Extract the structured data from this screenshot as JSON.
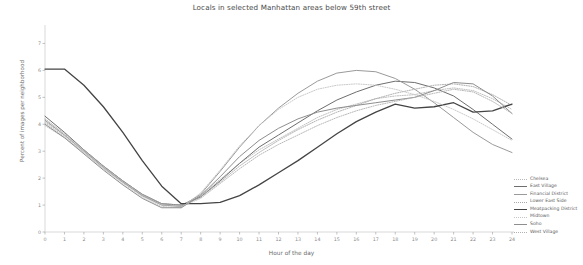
{
  "chart_data": {
    "type": "line",
    "title": "Locals in selected Manhattan areas below 59th street",
    "xlabel": "Hour of the day",
    "ylabel": "Percent of images per neighborhood",
    "grid": false,
    "legend_position": "right",
    "x": [
      0,
      1,
      2,
      3,
      4,
      5,
      6,
      7,
      8,
      9,
      10,
      11,
      12,
      13,
      14,
      15,
      16,
      17,
      18,
      19,
      20,
      21,
      22,
      23,
      24
    ],
    "xlim": [
      0,
      24
    ],
    "ylim": [
      0,
      7.5
    ],
    "xticks": [
      "0",
      "1",
      "2",
      "3",
      "4",
      "5",
      "6",
      "7",
      "8",
      "9",
      "10",
      "11",
      "12",
      "13",
      "14",
      "15",
      "16",
      "17",
      "18",
      "19",
      "20",
      "21",
      "22",
      "23",
      "24"
    ],
    "yticks": [
      "0",
      "1",
      "2",
      "3",
      "4",
      "5",
      "6",
      "7"
    ],
    "series": [
      {
        "name": "Chelsea",
        "color": "#b8b8b8",
        "style": "dotted",
        "width": 0.9,
        "values": [
          4.05,
          3.55,
          2.95,
          2.35,
          1.85,
          1.35,
          1.05,
          1.0,
          1.35,
          1.95,
          2.55,
          3.05,
          3.45,
          3.85,
          4.25,
          4.55,
          4.75,
          4.95,
          5.05,
          5.1,
          5.25,
          5.35,
          5.25,
          4.95,
          4.55
        ]
      },
      {
        "name": "East Village",
        "color": "#6e6e6e",
        "style": "solid",
        "width": 1.0,
        "values": [
          4.3,
          3.7,
          3.05,
          2.45,
          1.9,
          1.4,
          1.05,
          1.0,
          1.3,
          1.9,
          2.55,
          3.15,
          3.6,
          4.05,
          4.5,
          4.9,
          5.2,
          5.45,
          5.6,
          5.55,
          5.35,
          5.05,
          4.55,
          4.0,
          3.45
        ]
      },
      {
        "name": "Financial District",
        "color": "#9a9a9a",
        "style": "solid",
        "width": 1.0,
        "values": [
          4.15,
          3.6,
          3.0,
          2.4,
          1.85,
          1.35,
          1.0,
          0.95,
          1.4,
          2.25,
          3.15,
          3.95,
          4.6,
          5.15,
          5.6,
          5.9,
          6.0,
          5.95,
          5.7,
          5.3,
          4.8,
          4.25,
          3.7,
          3.25,
          2.95
        ]
      },
      {
        "name": "Lower East Side",
        "color": "#a8a8a8",
        "style": "dotted",
        "width": 0.9,
        "values": [
          4.2,
          3.65,
          3.05,
          2.45,
          1.9,
          1.4,
          1.05,
          1.0,
          1.3,
          1.85,
          2.45,
          2.95,
          3.4,
          3.8,
          4.15,
          4.45,
          4.7,
          4.95,
          5.15,
          5.3,
          5.45,
          5.5,
          5.4,
          5.1,
          4.7
        ]
      },
      {
        "name": "Meatpacking District",
        "color": "#444444",
        "style": "solid",
        "width": 1.3,
        "values": [
          6.05,
          6.05,
          5.45,
          4.65,
          3.7,
          2.65,
          1.7,
          1.05,
          1.05,
          1.1,
          1.35,
          1.75,
          2.2,
          2.65,
          3.15,
          3.65,
          4.1,
          4.45,
          4.75,
          4.6,
          4.65,
          4.8,
          4.45,
          4.5,
          4.75
        ]
      },
      {
        "name": "Midtown",
        "color": "#c4c4c4",
        "style": "dotted",
        "width": 0.9,
        "values": [
          3.95,
          3.5,
          2.95,
          2.35,
          1.8,
          1.3,
          0.95,
          0.9,
          1.45,
          2.3,
          3.2,
          3.95,
          4.55,
          5.0,
          5.3,
          5.45,
          5.5,
          5.45,
          5.3,
          5.1,
          4.85,
          4.55,
          4.2,
          3.8,
          3.4
        ]
      },
      {
        "name": "Soho",
        "color": "#8e8e8e",
        "style": "solid",
        "width": 1.0,
        "values": [
          4.0,
          3.5,
          2.9,
          2.3,
          1.75,
          1.25,
          0.9,
          0.9,
          1.35,
          2.05,
          2.8,
          3.4,
          3.85,
          4.2,
          4.45,
          4.6,
          4.7,
          4.8,
          4.9,
          5.0,
          5.25,
          5.55,
          5.5,
          5.05,
          4.4
        ]
      },
      {
        "name": "West Village",
        "color": "#b0b0b0",
        "style": "dotted",
        "width": 0.9,
        "values": [
          4.1,
          3.6,
          3.0,
          2.4,
          1.85,
          1.35,
          1.0,
          0.95,
          1.25,
          1.8,
          2.35,
          2.85,
          3.25,
          3.6,
          3.95,
          4.25,
          4.5,
          4.7,
          4.85,
          5.0,
          5.15,
          5.3,
          5.2,
          4.85,
          4.4
        ]
      }
    ]
  },
  "axis": {
    "axis_color": "#c9c9c9",
    "tick_color": "#9a9a9a"
  }
}
